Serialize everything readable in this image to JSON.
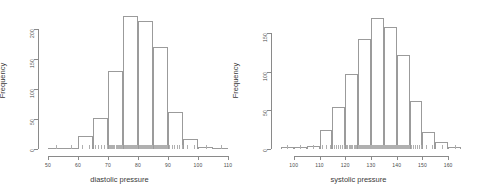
{
  "figure": {
    "background": "#ffffff",
    "foreground": "#8a8a8a",
    "bar_stroke": "#9b9b9b"
  },
  "chart_data": [
    {
      "type": "bar",
      "title": "",
      "xlabel": "diastolic pressure",
      "ylabel": "Frequency",
      "xlim": [
        50,
        110
      ],
      "ylim": [
        0,
        225
      ],
      "xticks": [
        50,
        60,
        70,
        80,
        90,
        100,
        110
      ],
      "yticks": [
        0,
        50,
        100,
        150,
        200
      ],
      "grid": false,
      "legend": "none",
      "bin_width": 5,
      "bin_edges": [
        50,
        55,
        60,
        65,
        70,
        75,
        80,
        85,
        90,
        95,
        100,
        105,
        110
      ],
      "categories": [
        "50-55",
        "55-60",
        "60-65",
        "65-70",
        "70-75",
        "75-80",
        "80-85",
        "85-90",
        "90-95",
        "95-100",
        "100-105",
        "105-110"
      ],
      "values": [
        2,
        2,
        22,
        52,
        130,
        222,
        213,
        170,
        62,
        17,
        3,
        2
      ],
      "rug": true
    },
    {
      "type": "bar",
      "title": "",
      "xlabel": "systolic pressure",
      "ylabel": "Frequency",
      "xlim": [
        95,
        165
      ],
      "ylim": [
        0,
        175
      ],
      "xticks": [
        100,
        110,
        120,
        130,
        140,
        150,
        160
      ],
      "yticks": [
        0,
        50,
        100,
        150
      ],
      "grid": false,
      "legend": "none",
      "bin_width": 5,
      "bin_edges": [
        95,
        100,
        105,
        110,
        115,
        120,
        125,
        130,
        135,
        140,
        145,
        150,
        155,
        160,
        165
      ],
      "categories": [
        "95-100",
        "100-105",
        "105-110",
        "110-115",
        "115-120",
        "120-125",
        "125-130",
        "130-135",
        "135-140",
        "140-145",
        "145-150",
        "150-155",
        "155-160",
        "160-165"
      ],
      "values": [
        2,
        3,
        4,
        25,
        54,
        97,
        142,
        170,
        158,
        122,
        62,
        22,
        9,
        3
      ],
      "rug": true
    }
  ]
}
